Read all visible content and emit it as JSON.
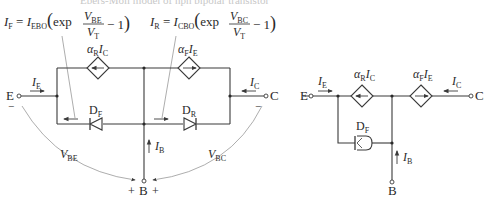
{
  "caption": "Ebers-Moll model of npn bipolar transistor",
  "left_circuit": {
    "eq_forward": {
      "lhs": "I",
      "lhs_sub": "F",
      "coef": "I",
      "coef_sub": "EBO",
      "fn": "exp",
      "num": "V",
      "num_sub": "BE",
      "den": "V",
      "den_sub": "T",
      "tail": "− 1"
    },
    "eq_reverse": {
      "lhs": "I",
      "lhs_sub": "R",
      "coef": "I",
      "coef_sub": "CBO",
      "fn": "exp",
      "num": "V",
      "num_sub": "BC",
      "den": "V",
      "den_sub": "T",
      "tail": "− 1"
    },
    "source_left": {
      "alpha": "α",
      "alpha_sub": "R",
      "i": "I",
      "i_sub": "C"
    },
    "source_right": {
      "alpha": "α",
      "alpha_sub": "F",
      "i": "I",
      "i_sub": "E"
    },
    "diode_f": {
      "d": "D",
      "sub": "F"
    },
    "diode_r": {
      "d": "D",
      "sub": "R"
    },
    "terminal_e": "E",
    "terminal_c": "C",
    "terminal_b": "B",
    "ie": {
      "i": "I",
      "sub": "E"
    },
    "ic": {
      "i": "I",
      "sub": "C"
    },
    "ib": {
      "i": "I",
      "sub": "B"
    },
    "vbe": {
      "v": "V",
      "sub": "BE"
    },
    "vbc": {
      "v": "V",
      "sub": "BC"
    },
    "plus": "+",
    "minus": "−"
  },
  "right_circuit": {
    "terminal_e": "E",
    "terminal_c": "C",
    "terminal_b": "B",
    "ie": {
      "i": "I",
      "sub": "E"
    },
    "ic": {
      "i": "I",
      "sub": "C"
    },
    "ib": {
      "i": "I",
      "sub": "B"
    },
    "source_left": {
      "alpha": "α",
      "alpha_sub": "R",
      "i": "I",
      "i_sub": "C"
    },
    "source_right": {
      "alpha": "α",
      "alpha_sub": "F",
      "i": "I",
      "i_sub": "E"
    },
    "diode_f": {
      "d": "D",
      "sub": "F"
    }
  }
}
